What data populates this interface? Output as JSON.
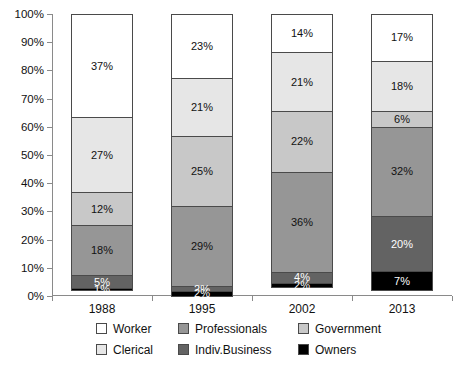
{
  "chart_data": {
    "type": "bar",
    "title": "",
    "subtitle": "",
    "xlabel": "",
    "ylabel": "",
    "stacked": true,
    "stack_total": 100,
    "ylim": [
      0,
      100
    ],
    "grid": false,
    "legend_position": "bottom",
    "categories": [
      "1988",
      "1995",
      "2002",
      "2013"
    ],
    "ytick_labels": [
      "0%",
      "10%",
      "20%",
      "30%",
      "40%",
      "50%",
      "60%",
      "70%",
      "80%",
      "90%",
      "100%"
    ],
    "ytick_values": [
      0,
      10,
      20,
      30,
      40,
      50,
      60,
      70,
      80,
      90,
      100
    ],
    "series": [
      {
        "name": "Owners",
        "color": "#000000",
        "values": [
          1,
          2,
          2,
          7
        ],
        "labels": [
          "1%",
          "2%",
          "2%",
          "7%"
        ]
      },
      {
        "name": "Indiv.Business",
        "color": "#636363",
        "values": [
          5,
          2,
          4,
          20
        ],
        "labels": [
          "5%",
          "2%",
          "4%",
          "20%"
        ]
      },
      {
        "name": "Professionals",
        "color": "#969696",
        "values": [
          18,
          29,
          36,
          32
        ],
        "labels": [
          "18%",
          "29%",
          "36%",
          "32%"
        ]
      },
      {
        "name": "Government",
        "color": "#c8c8c8",
        "values": [
          12,
          25,
          22,
          6
        ],
        "labels": [
          "12%",
          "25%",
          "22%",
          "6%"
        ]
      },
      {
        "name": "Clerical",
        "color": "#e6e6e6",
        "values": [
          27,
          21,
          21,
          18
        ],
        "labels": [
          "27%",
          "21%",
          "21%",
          "18%"
        ]
      },
      {
        "name": "Worker",
        "color": "#ffffff",
        "values": [
          37,
          23,
          14,
          17
        ],
        "labels": [
          "37%",
          "23%",
          "14%",
          "17%"
        ]
      }
    ]
  },
  "legend": {
    "entries": [
      {
        "label": "Worker",
        "color": "#ffffff"
      },
      {
        "label": "Professionals",
        "color": "#969696"
      },
      {
        "label": "Government",
        "color": "#c8c8c8"
      },
      {
        "label": "Clerical",
        "color": "#e6e6e6"
      },
      {
        "label": "Indiv.Business",
        "color": "#636363"
      },
      {
        "label": "Owners",
        "color": "#000000"
      }
    ]
  }
}
